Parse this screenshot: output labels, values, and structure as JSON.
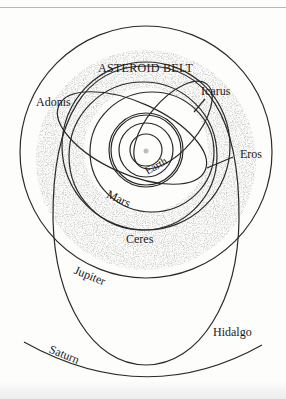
{
  "diagram": {
    "title": "ASTEROID BELT",
    "sun": {
      "label": "",
      "cx": 146,
      "cy": 150
    },
    "labels": {
      "asteroid_belt": "ASTEROID BELT",
      "adonis": "Adonis",
      "icarus": "Icarus",
      "eros": "Eros",
      "earth": "Earth",
      "mars": "Mars",
      "ceres": "Ceres",
      "jupiter": "Jupiter",
      "hidalgo": "Hidalgo",
      "saturn": "Saturn"
    },
    "orbits": [
      {
        "name": "Earth",
        "type": "planet"
      },
      {
        "name": "Mars",
        "type": "planet"
      },
      {
        "name": "Jupiter",
        "type": "planet"
      },
      {
        "name": "Saturn",
        "type": "planet"
      },
      {
        "name": "Icarus",
        "type": "asteroid"
      },
      {
        "name": "Adonis",
        "type": "asteroid"
      },
      {
        "name": "Eros",
        "type": "asteroid"
      },
      {
        "name": "Ceres",
        "type": "asteroid"
      },
      {
        "name": "Hidalgo",
        "type": "asteroid"
      }
    ],
    "colors": {
      "line": "#2a2a2a",
      "belt": "#b5b5b5",
      "background": "#fdfdfc"
    }
  }
}
